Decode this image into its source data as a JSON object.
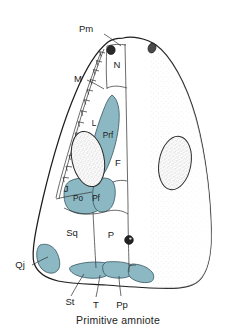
{
  "figure": {
    "caption": "Primitive amniote",
    "view": "dorsal skull roof",
    "background_color": "#ffffff",
    "outline_color": "#1e1e1e",
    "highlight_color": "#8cb8c4",
    "highlight_color_dark": "#6fa3b2",
    "stipple_color": "#8a8a8a",
    "label_color": "#1b1b1b"
  },
  "labels": {
    "pm": "Pm",
    "n": "N",
    "m": "M",
    "l": "L",
    "prf": "Prf",
    "f": "F",
    "j": "J",
    "po": "Po",
    "pf": "Pf",
    "sq": "Sq",
    "p": "P",
    "qj": "Qj",
    "st": "St",
    "t": "T",
    "pp": "Pp"
  },
  "bones": [
    {
      "code": "Pm",
      "name": "premaxilla",
      "highlighted": false
    },
    {
      "code": "N",
      "name": "nasal",
      "highlighted": false
    },
    {
      "code": "M",
      "name": "maxilla",
      "highlighted": false
    },
    {
      "code": "L",
      "name": "lacrimal",
      "highlighted": false
    },
    {
      "code": "Prf",
      "name": "prefrontal",
      "highlighted": true
    },
    {
      "code": "F",
      "name": "frontal",
      "highlighted": false
    },
    {
      "code": "J",
      "name": "jugal",
      "highlighted": false
    },
    {
      "code": "Po",
      "name": "postorbital",
      "highlighted": true
    },
    {
      "code": "Pf",
      "name": "postfrontal",
      "highlighted": true
    },
    {
      "code": "Sq",
      "name": "squamosal",
      "highlighted": false
    },
    {
      "code": "P",
      "name": "parietal",
      "highlighted": false
    },
    {
      "code": "Qj",
      "name": "quadratojugal",
      "highlighted": true
    },
    {
      "code": "St",
      "name": "supratemporal",
      "highlighted": true
    },
    {
      "code": "T",
      "name": "tabular",
      "highlighted": true
    },
    {
      "code": "Pp",
      "name": "postparietal",
      "highlighted": true
    }
  ],
  "features": [
    {
      "name": "left-orbit",
      "kind": "stippled-ellipse"
    },
    {
      "name": "right-orbit",
      "kind": "stippled-ellipse"
    },
    {
      "name": "pineal-foramen",
      "kind": "dark-dot"
    },
    {
      "name": "left-naris",
      "kind": "dark-dot"
    },
    {
      "name": "right-naris",
      "kind": "dark-dot"
    },
    {
      "name": "tooth-row",
      "kind": "serrated-edge"
    }
  ]
}
